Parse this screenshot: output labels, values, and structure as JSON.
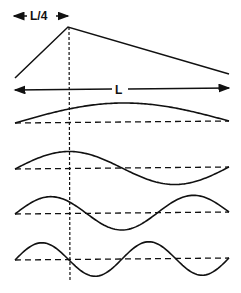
{
  "diagram": {
    "labels": {
      "quarter": "L/4",
      "length": "L"
    },
    "colors": {
      "stroke": "#111111",
      "background": "#ffffff"
    },
    "triangle": {
      "left": [
        15,
        78
      ],
      "peak": [
        68,
        27
      ],
      "right": [
        229,
        74
      ]
    },
    "modes": [
      {
        "name": "mode-1",
        "harmonic": 1,
        "baseline_y": 122,
        "amplitude": 19
      },
      {
        "name": "mode-2",
        "harmonic": 2,
        "baseline_y": 168,
        "amplitude": 17
      },
      {
        "name": "mode-3",
        "harmonic": 3,
        "baseline_y": 213,
        "amplitude": 17
      },
      {
        "name": "mode-4",
        "harmonic": 4,
        "baseline_y": 259,
        "amplitude": 17
      }
    ],
    "x_start": 15,
    "x_end": 229,
    "marker_x": 69
  }
}
